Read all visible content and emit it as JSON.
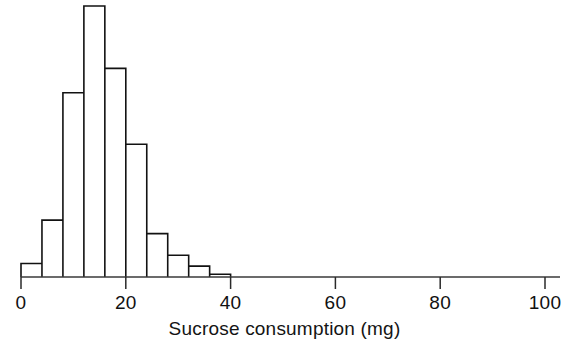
{
  "chart_data": {
    "type": "bar",
    "title": "",
    "subtitle": "",
    "xlabel": "Sucrose consumption (mg)",
    "ylabel": "",
    "grid": false,
    "legend": null,
    "xlim": [
      0,
      100
    ],
    "ylim": [
      0,
      100
    ],
    "xticks": [
      0,
      20,
      40,
      60,
      80,
      100
    ],
    "xtick_labels": [
      "0",
      "20",
      "40",
      "60",
      "80",
      "100"
    ],
    "bin_width": 4,
    "bin_edges": [
      0,
      4,
      8,
      12,
      16,
      20,
      24,
      28,
      32,
      36,
      40
    ],
    "categories": [
      "0-4",
      "4-8",
      "8-12",
      "12-16",
      "16-20",
      "20-24",
      "24-28",
      "28-32",
      "32-36",
      "36-40"
    ],
    "values": [
      5,
      21,
      68,
      100,
      77,
      49,
      16,
      8,
      4,
      1
    ]
  },
  "axis": {
    "x_axis_name": "x-axis",
    "tick_label_0": "0",
    "tick_label_20": "20",
    "tick_label_40": "40",
    "tick_label_60": "60",
    "tick_label_80": "80",
    "tick_label_100": "100",
    "x_axis_title": "Sucrose consumption (mg)"
  },
  "colors": {
    "bar_stroke": "#121212",
    "axis": "#3a3a3a",
    "background": "#ffffff",
    "text": "#111111"
  }
}
